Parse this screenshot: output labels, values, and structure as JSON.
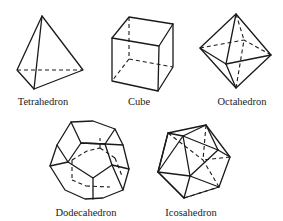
{
  "figure": {
    "solids": [
      {
        "name": "Tetrahedron",
        "label": "Tetrahedron"
      },
      {
        "name": "Cube",
        "label": "Cube"
      },
      {
        "name": "Octahedron",
        "label": "Octahedron"
      },
      {
        "name": "Dodecahedron",
        "label": "Dodecahedron"
      },
      {
        "name": "Icosahedron",
        "label": "Icosahedron"
      }
    ]
  }
}
